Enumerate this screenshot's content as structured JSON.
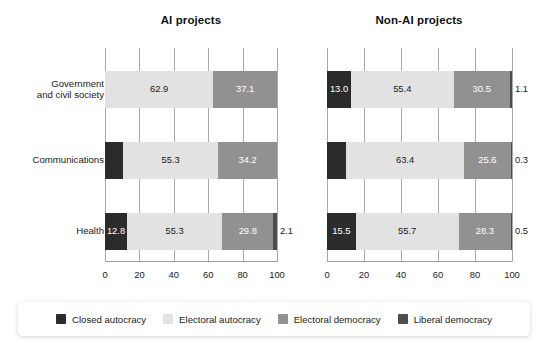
{
  "chart_data": {
    "type": "bar",
    "orientation": "horizontal",
    "stacked": true,
    "stack_total": 100,
    "panels": [
      {
        "title": "AI projects",
        "categories": [
          "Government\nand civil society",
          "Communications",
          "Health"
        ],
        "series": [
          {
            "name": "Closed autocracy",
            "color": "#2b2b2b",
            "values": [
              0.0,
              10.5,
              12.8
            ]
          },
          {
            "name": "Electoral autocracy",
            "color": "#e2e2e2",
            "values": [
              62.9,
              55.3,
              55.3
            ]
          },
          {
            "name": "Electoral democracy",
            "color": "#919191",
            "values": [
              37.1,
              34.2,
              29.8
            ]
          },
          {
            "name": "Liberal democracy",
            "color": "#4d4d4d",
            "values": [
              0.0,
              0.0,
              2.1
            ]
          }
        ],
        "labels": [
          [
            "",
            "62.9",
            "37.1",
            ""
          ],
          [
            "10.5",
            "55.3",
            "34.2",
            ""
          ],
          [
            "12.8",
            "55.3",
            "29.8",
            "2.1"
          ]
        ]
      },
      {
        "title": "Non-AI projects",
        "categories": [
          "Government\nand civil society",
          "Communications",
          "Health"
        ],
        "series": [
          {
            "name": "Closed autocracy",
            "color": "#2b2b2b",
            "values": [
              13.0,
              10.5,
              15.5
            ]
          },
          {
            "name": "Electoral autocracy",
            "color": "#e2e2e2",
            "values": [
              55.4,
              63.4,
              55.7
            ]
          },
          {
            "name": "Electoral democracy",
            "color": "#919191",
            "values": [
              30.5,
              25.6,
              28.3
            ]
          },
          {
            "name": "Liberal democracy",
            "color": "#4d4d4d",
            "values": [
              1.1,
              0.3,
              0.5
            ]
          }
        ],
        "labels": [
          [
            "13.0",
            "55.4",
            "30.5",
            "1.1"
          ],
          [
            "10.5",
            "63.4",
            "25.6",
            "0.3"
          ],
          [
            "15.5",
            "55.7",
            "28.3",
            "0.5"
          ]
        ]
      }
    ],
    "xlabel": "",
    "ylabel": "",
    "xlim": [
      0,
      100
    ],
    "xticks": [
      "0",
      "20",
      "40",
      "60",
      "80",
      "100"
    ],
    "grid": true,
    "legend_position": "bottom",
    "legend": [
      {
        "label": "Closed autocracy",
        "color": "#2b2b2b"
      },
      {
        "label": "Electoral autocracy",
        "color": "#e2e2e2"
      },
      {
        "label": "Electoral democracy",
        "color": "#919191"
      },
      {
        "label": "Liberal democracy",
        "color": "#4d4d4d"
      }
    ],
    "colors": {
      "closed_autocracy": "#2b2b2b",
      "electoral_autocracy": "#e2e2e2",
      "electoral_democracy": "#919191",
      "liberal_democracy": "#4d4d4d",
      "gridline": "#a8a8a8",
      "background": "#ffffff"
    }
  }
}
